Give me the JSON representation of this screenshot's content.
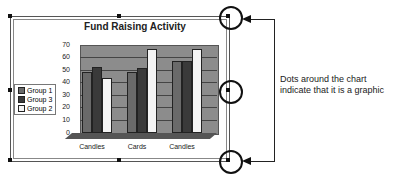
{
  "chart_data": {
    "type": "bar",
    "title": "Fund Raising Activity",
    "categories": [
      "Candles",
      "Cards",
      "Candles"
    ],
    "series": [
      {
        "name": "Group 1",
        "values": [
          50,
          50,
          60
        ],
        "color": "#6a6a6a"
      },
      {
        "name": "Group 3",
        "values": [
          55,
          54,
          60
        ],
        "color": "#3a3a3a"
      },
      {
        "name": "Group 2",
        "values": [
          45,
          70,
          70
        ],
        "color": "#f4f4f4"
      }
    ],
    "xlabel": "",
    "ylabel": "",
    "ylim": [
      0,
      70
    ],
    "yticks": [
      "70",
      "60",
      "50",
      "40",
      "30",
      "20",
      "10",
      "0"
    ],
    "grid": true,
    "legend_position": "left",
    "style": "3d"
  },
  "legend": [
    "Group 1",
    "Group 3",
    "Group 2"
  ],
  "annotation": {
    "line1": "Dots around the chart",
    "line2": "indicate that it is a graphic"
  }
}
